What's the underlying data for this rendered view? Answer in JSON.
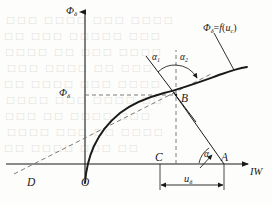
{
  "figure": {
    "kind": "engineering-line-diagram",
    "background_color": "#fdfdfb",
    "ink_color": "#1a1a1a",
    "dash_color": "#7d7d7d",
    "axes": {
      "y_label": {
        "base": "Φ",
        "sub": "δ"
      },
      "x_label": {
        "base": "IW"
      }
    },
    "value_labels": {
      "phi_delta": {
        "base": "Φ",
        "sub": "δ"
      },
      "u_delta": {
        "base": "u",
        "sub": "δ"
      }
    },
    "points": [
      {
        "id": "origin",
        "name": "O",
        "x": 85,
        "y": 183
      },
      {
        "id": "point-d",
        "name": "D",
        "x": 31,
        "y": 183
      },
      {
        "id": "point-c",
        "name": "C",
        "x": 160,
        "y": 164
      },
      {
        "id": "point-a",
        "name": "A",
        "x": 224,
        "y": 164
      },
      {
        "id": "point-b",
        "name": "B",
        "x": 176,
        "y": 95
      }
    ],
    "angles": [
      {
        "id": "alpha-1",
        "base": "α",
        "sub": "1",
        "x": 152,
        "y": 57
      },
      {
        "id": "alpha-2",
        "base": "α",
        "sub": "2",
        "x": 180,
        "y": 57
      },
      {
        "id": "alpha",
        "base": "α",
        "sub": "",
        "x": 206,
        "y": 155
      }
    ],
    "curve_label": {
      "base": "Φ",
      "sub": "δ",
      "equals": "=",
      "fn": "f",
      "open": "(",
      "arg_base": "u",
      "arg_sub": "c",
      "close": ")",
      "x": 205,
      "y": 24
    },
    "ghost_text": [
      {
        "text": "□□□ □□□□ □□□ □□□□",
        "x": 6,
        "y": 14
      },
      {
        "text": "□□ □□□ □□□□□ □□□",
        "x": 4,
        "y": 30
      },
      {
        "text": "□□□□ □□ □□□ □□□□",
        "x": 5,
        "y": 46
      },
      {
        "text": "□□□ □□□□ □□ □□□",
        "x": 7,
        "y": 62
      },
      {
        "text": "□□ □□□□ □□□ □□□□",
        "x": 4,
        "y": 78
      },
      {
        "text": "□□□□ □□□ □□□□ □□",
        "x": 6,
        "y": 94
      },
      {
        "text": "□□□ □□ □□□□ □□□",
        "x": 5,
        "y": 110
      },
      {
        "text": "□□□□ □□□ □□ □□□□",
        "x": 7,
        "y": 126
      },
      {
        "text": "□□ □□□□ □□□ □□",
        "x": 4,
        "y": 142
      }
    ]
  },
  "chart_data": {
    "type": "line",
    "title": "",
    "xlabel": "IW",
    "ylabel": "Φδ",
    "grid": false,
    "legend": "none",
    "annotations": [
      "Φδ=f(uc)",
      "α1",
      "α2",
      "α",
      "uδ",
      "Φδ",
      "O",
      "D",
      "C",
      "A",
      "B"
    ],
    "series": [
      {
        "name": "saturation-curve",
        "style": "solid",
        "points_px": [
          [
            85,
            183
          ],
          [
            88,
            168
          ],
          [
            92,
            155
          ],
          [
            97,
            143
          ],
          [
            103,
            132
          ],
          [
            110,
            122
          ],
          [
            118,
            113
          ],
          [
            127,
            106
          ],
          [
            137,
            100
          ],
          [
            148,
            96
          ],
          [
            160,
            92
          ],
          [
            176,
            95
          ],
          [
            190,
            80
          ],
          [
            205,
            76
          ],
          [
            220,
            72
          ],
          [
            235,
            69
          ],
          [
            247,
            67
          ]
        ]
      },
      {
        "name": "chord-line-D-B-extended",
        "style": "dashed",
        "points_px": [
          [
            18,
            178
          ],
          [
            31,
            183
          ],
          [
            176,
            95
          ],
          [
            213,
            73
          ]
        ]
      },
      {
        "name": "tangent-line-through-B",
        "style": "solid",
        "points_px": [
          [
            148,
            58
          ],
          [
            176,
            95
          ],
          [
            194,
            119
          ]
        ]
      },
      {
        "name": "load-line-B-to-A",
        "style": "solid",
        "points_px": [
          [
            176,
            95
          ],
          [
            224,
            164
          ]
        ]
      },
      {
        "name": "curve-leader-line",
        "style": "solid",
        "points_px": [
          [
            215,
            34
          ],
          [
            233,
            70
          ]
        ]
      }
    ],
    "guides": [
      {
        "name": "horizontal-dashed-phi",
        "style": "dashed",
        "points_px": [
          [
            85,
            95
          ],
          [
            176,
            95
          ]
        ]
      },
      {
        "name": "vertical-dashed-C-B",
        "style": "dashed",
        "points_px": [
          [
            176,
            164
          ],
          [
            176,
            52
          ]
        ]
      }
    ],
    "dimension": {
      "name": "u-delta-dimension",
      "from_px": [
        160,
        183
      ],
      "to_px": [
        224,
        183
      ],
      "label": "uδ"
    }
  }
}
